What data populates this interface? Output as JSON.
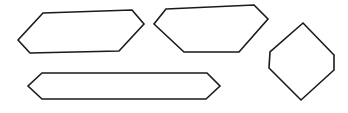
{
  "canvas": {
    "width": 348,
    "height": 113,
    "background": "#ffffff"
  },
  "style": {
    "stroke": "#1a1a1a",
    "fill": "#ffffff"
  },
  "shapes": [
    {
      "id": "hexagon-top-left",
      "type": "irregular-hexagon",
      "points": "43,13 132,10 144,24 119,51 30,53 18,40"
    },
    {
      "id": "hexagon-top-middle",
      "type": "irregular-hexagon",
      "points": "166,9 254,5 268,19 239,52 184,52 154,24"
    },
    {
      "id": "hexagon-right-vertical",
      "type": "irregular-hexagon",
      "points": "303,23 334,55 334,70 301,100 269,68 270,52"
    },
    {
      "id": "hexagon-bottom-elongated",
      "type": "irregular-hexagon",
      "points": "42,73 207,73 220,86 206,99 42,99 28,86"
    }
  ]
}
